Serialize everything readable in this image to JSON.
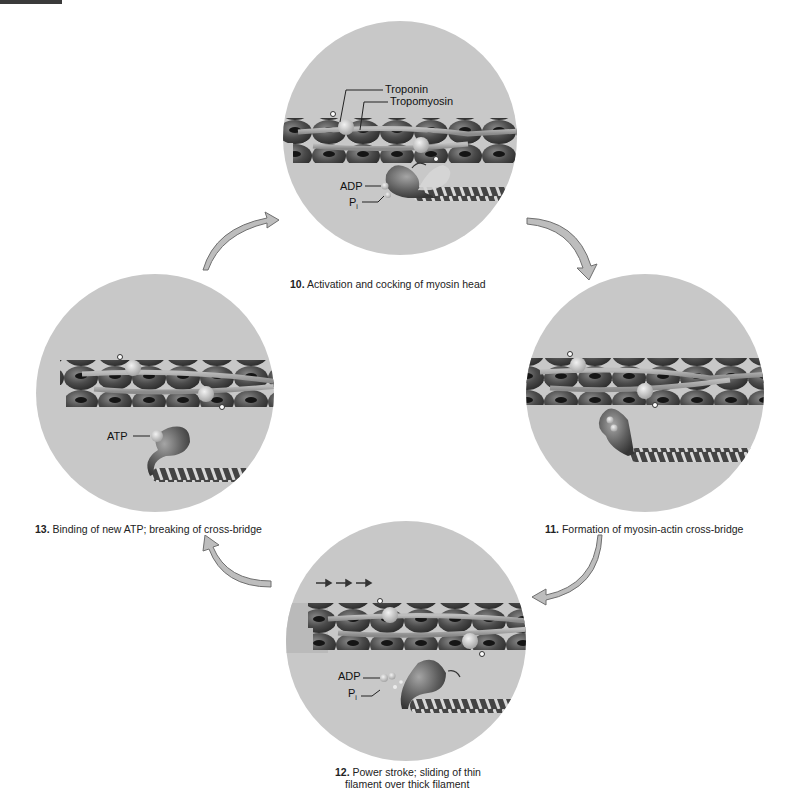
{
  "figure": {
    "steps": [
      {
        "id": "10",
        "number": "10.",
        "text": "Activation and cocking of myosin head"
      },
      {
        "id": "11",
        "number": "11.",
        "text": "Formation of myosin-actin cross-bridge"
      },
      {
        "id": "12",
        "number": "12.",
        "text_line1": "Power stroke; sliding of thin",
        "text_line2": "filament over thick filament"
      },
      {
        "id": "13",
        "number": "13.",
        "text": "Binding of new ATP; breaking of cross-bridge"
      }
    ],
    "labels": {
      "troponin": "Troponin",
      "tropomyosin": "Tropomyosin",
      "adp": "ADP",
      "pi_main": "P",
      "pi_sub": "i",
      "atp": "ATP"
    },
    "colors": {
      "circle_fill": "#c8c8c8",
      "actin_dark": "#4a4a4a",
      "tropomyosin": "#9a9a9a",
      "arrow_fill": "#bdbdbd",
      "arrow_stroke": "#6f6f6f",
      "background": "#ffffff"
    }
  }
}
